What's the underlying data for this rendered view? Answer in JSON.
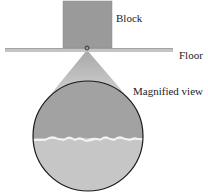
{
  "labels": {
    "block": "Block",
    "floor": "Floor",
    "magnified": "Magnified view"
  },
  "colors": {
    "block": "#9a9a9a",
    "floor": "#c4c4c4",
    "cone": "#b8b8b8",
    "upper_surface": "#a2a2a2",
    "lower_surface": "#c6c6c6",
    "interface": "#f2f2f2",
    "circle_stroke": "#1a1a1a"
  }
}
